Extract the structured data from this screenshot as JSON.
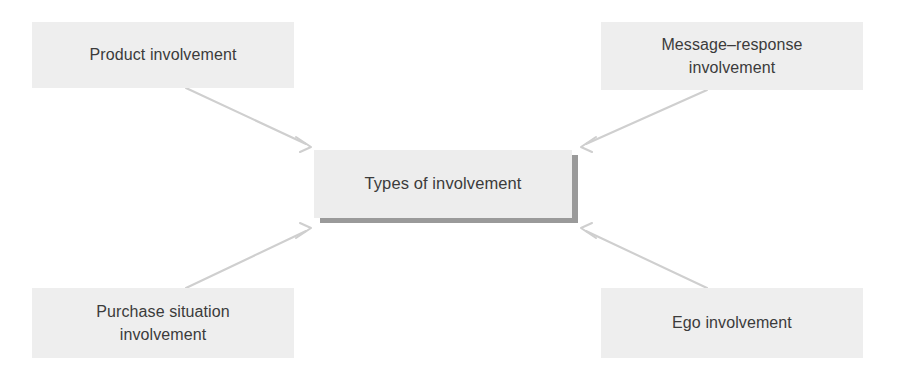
{
  "diagram": {
    "title_text": "Types of involvement",
    "background_color": "#ffffff",
    "box_fill_color": "#eeeeee",
    "text_color": "#3b3b3b",
    "connector_color": "#cfcfcf",
    "shadow_color": "#9a9a9a",
    "center": {
      "id": "types-of-involvement",
      "label": "Types of involvement"
    },
    "nodes": [
      {
        "id": "product-involvement",
        "label": "Product involvement",
        "position": "top-left"
      },
      {
        "id": "message-response-involvement",
        "label": "Message–response\ninvolvement",
        "position": "top-right"
      },
      {
        "id": "purchase-situation-involvement",
        "label": "Purchase situation\ninvolvement",
        "position": "bottom-left"
      },
      {
        "id": "ego-involvement",
        "label": "Ego involvement",
        "position": "bottom-right"
      }
    ],
    "connectors": [
      {
        "id": "arrow-product-to-center",
        "from": "product-involvement",
        "to": "types-of-involvement",
        "direction": "down-right"
      },
      {
        "id": "arrow-message-response-to-center",
        "from": "message-response-involvement",
        "to": "types-of-involvement",
        "direction": "down-left"
      },
      {
        "id": "arrow-purchase-situation-to-center",
        "from": "purchase-situation-involvement",
        "to": "types-of-involvement",
        "direction": "up-right"
      },
      {
        "id": "arrow-ego-to-center",
        "from": "ego-involvement",
        "to": "types-of-involvement",
        "direction": "up-left"
      }
    ]
  }
}
